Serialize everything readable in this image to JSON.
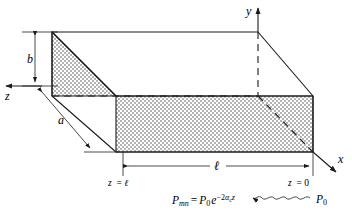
{
  "figure": {
    "axes": [
      {
        "name": "y-axis",
        "label": "y",
        "direction": "up"
      },
      {
        "name": "x-axis",
        "label": "x",
        "direction": "down-right"
      },
      {
        "name": "z-axis",
        "label": "z",
        "direction": "left"
      }
    ],
    "dimensions": [
      {
        "name": "height",
        "label": "b",
        "orientation": "vertical"
      },
      {
        "name": "width",
        "label": "a",
        "orientation": "diagonal"
      },
      {
        "name": "length",
        "label": "ℓ",
        "orientation": "horizontal"
      }
    ],
    "station_labels": [
      {
        "name": "z-equals-ell",
        "text": "z = ℓ"
      },
      {
        "name": "z-equals-zero",
        "text": "z = 0"
      }
    ],
    "equation": {
      "lhs_symbol": "P",
      "lhs_subscript": "mn",
      "equals": "=",
      "rhs_symbol": "P",
      "rhs_subscript": "0",
      "exp_base": "e",
      "exp_minus": "−",
      "exp_coefficient": "2",
      "exp_alpha": "α",
      "exp_alpha_subscript": "c",
      "exp_variable": "z",
      "full_text": "P_mn = P_0 e^(−2α_c z)"
    },
    "incident_wave": {
      "name": "incident-power-label",
      "symbol": "P",
      "subscript": "0",
      "arrow_direction": "left",
      "arrow_style": "wavy"
    },
    "colors": {
      "ink": "#1a1a1a",
      "shading_fill": "#d6d6d6",
      "shading_dot": "#b4b4b4",
      "background": "#ffffff"
    }
  }
}
